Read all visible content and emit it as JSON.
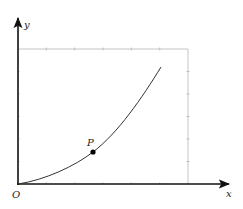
{
  "figure": {
    "type": "coordinate-diagram",
    "axes": {
      "x_label": "x",
      "y_label": "y",
      "origin_label": "O"
    },
    "point": {
      "label": "P",
      "description": "point on curve"
    },
    "curve": {
      "description": "increasing convex curve from origin",
      "shape": "parabola-like"
    },
    "bounding_box": {
      "description": "light gray rectangle with tick marks on top and right edges",
      "ticks_top": 6,
      "ticks_right": 6
    },
    "colors": {
      "axis": "#111111",
      "curve": "#333333",
      "box": "#b5b5b5",
      "point": "#000000"
    }
  }
}
